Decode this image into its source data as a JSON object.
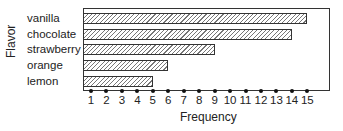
{
  "chart_data": {
    "type": "bar",
    "orientation": "horizontal",
    "title": "",
    "xlabel": "Frequency",
    "ylabel": "Flavor",
    "categories": [
      "vanilla",
      "chocolate",
      "strawberry",
      "orange",
      "lemon"
    ],
    "values": [
      15,
      14,
      9,
      6,
      5
    ],
    "xticks": [
      "1",
      "2",
      "3",
      "4",
      "5",
      "6",
      "7",
      "8",
      "9",
      "10",
      "11",
      "12",
      "13",
      "14",
      "15"
    ],
    "xlim": [
      0.5,
      16
    ],
    "grid": false,
    "legend": null,
    "bar_fill": "diagonal-hatch"
  }
}
